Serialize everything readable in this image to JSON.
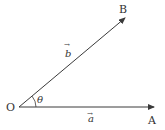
{
  "diagram": {
    "title": "",
    "colors": {
      "line": "#3a3a3a",
      "text": "#333333",
      "background": "#ffffff"
    },
    "points": {
      "origin": "O",
      "a_end": "A",
      "b_end": "B"
    },
    "vectors": [
      {
        "name": "a",
        "label": "a",
        "from": "O",
        "to": "A",
        "arrow": "→"
      },
      {
        "name": "b",
        "label": "b",
        "from": "O",
        "to": "B",
        "arrow": "→"
      }
    ],
    "angle": {
      "label": "θ",
      "between": [
        "a",
        "b"
      ]
    }
  }
}
